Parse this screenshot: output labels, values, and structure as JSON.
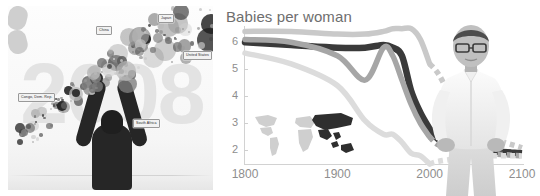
{
  "left_panel": {
    "name": "bubble-chart-stage",
    "year_backdrop": "2008",
    "country_labels": [
      {
        "label": "China",
        "x": 96,
        "y": 26
      },
      {
        "label": "Japan",
        "x": 158,
        "y": 14
      },
      {
        "label": "United States",
        "x": 183,
        "y": 51
      },
      {
        "label": "Congo, Dem. Rep.",
        "x": 18,
        "y": 93
      },
      {
        "label": "South Africa",
        "x": 133,
        "y": 119
      }
    ],
    "presenter_alt": "presenter-silhouette-arms-raised"
  },
  "right_panel": {
    "title": "Babies per woman",
    "presenter_alt": "hans-rosling-photo",
    "map_inset": {
      "name": "world-map-inset",
      "highlighted_region": "Asia"
    }
  },
  "chart_data": {
    "type": "line",
    "title": "Babies per woman",
    "xlabel": "",
    "ylabel": "Babies per woman",
    "xlim": [
      1800,
      2100
    ],
    "ylim": [
      1.5,
      6.6
    ],
    "xticks": [
      1800,
      1900,
      2000,
      2100
    ],
    "yticks": [
      2,
      3,
      4,
      5,
      6
    ],
    "grid": false,
    "legend": "none",
    "projection_start_year": 2000,
    "projection_style": "dashed",
    "x": [
      1800,
      1850,
      1900,
      1930,
      1950,
      1960,
      1970,
      1980,
      1990,
      2000,
      2010,
      2030,
      2060,
      2100
    ],
    "series": [
      {
        "name": "Africa",
        "color": "#c9c9c9",
        "values": [
          6.4,
          6.4,
          6.3,
          6.3,
          6.4,
          6.5,
          6.5,
          6.5,
          6.1,
          5.2,
          4.8,
          3.6,
          2.6,
          2.1
        ]
      },
      {
        "name": "Asia",
        "color": "#3a3a3a",
        "values": [
          6.0,
          5.9,
          5.8,
          5.8,
          5.9,
          5.8,
          5.5,
          4.2,
          3.4,
          2.8,
          2.4,
          2.2,
          2.0,
          1.9
        ]
      },
      {
        "name": "Americas",
        "color": "#a6a6a6",
        "values": [
          6.1,
          6.0,
          5.5,
          4.6,
          5.8,
          5.5,
          4.6,
          3.7,
          3.0,
          2.5,
          2.2,
          2.0,
          1.9,
          1.8
        ]
      },
      {
        "name": "Europe",
        "color": "#dcdcdc",
        "values": [
          5.6,
          5.2,
          4.4,
          3.1,
          2.6,
          2.6,
          2.3,
          1.9,
          1.8,
          1.5,
          1.6,
          1.7,
          1.8,
          1.8
        ]
      }
    ]
  }
}
